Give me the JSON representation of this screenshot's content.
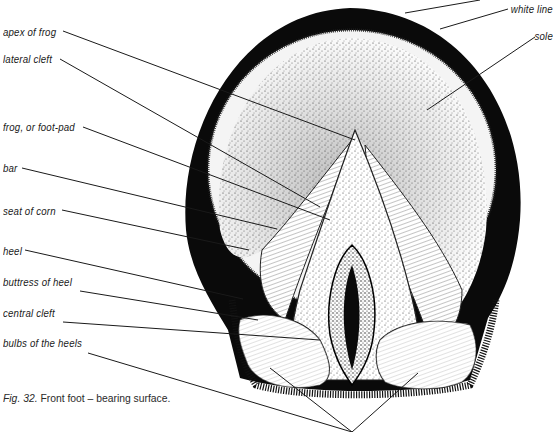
{
  "figure": {
    "caption_prefix": "Fig. 32.",
    "caption_text": " Front foot – bearing surface."
  },
  "labels_left": [
    {
      "id": "apex-of-frog",
      "text": "apex of frog",
      "x": 3,
      "y": 26
    },
    {
      "id": "lateral-cleft",
      "text": "lateral cleft",
      "x": 3,
      "y": 53
    },
    {
      "id": "frog",
      "text": "frog, or foot-pad",
      "x": 3,
      "y": 121
    },
    {
      "id": "bar",
      "text": "bar",
      "x": 3,
      "y": 162
    },
    {
      "id": "seat-of-corn",
      "text": "seat of corn",
      "x": 3,
      "y": 205
    },
    {
      "id": "heel",
      "text": "heel",
      "x": 3,
      "y": 245
    },
    {
      "id": "buttress-of-heel",
      "text": "buttress of heel",
      "x": 3,
      "y": 276
    },
    {
      "id": "central-cleft",
      "text": "central cleft",
      "x": 3,
      "y": 307
    },
    {
      "id": "bulbs-of-the-heels",
      "text": "bulbs of the heels",
      "x": 3,
      "y": 337
    }
  ],
  "labels_right": [
    {
      "id": "white-line",
      "text": "white line",
      "x": 509,
      "y": 3
    },
    {
      "id": "sole",
      "text": "sole",
      "x": 537,
      "y": 30
    }
  ],
  "colors": {
    "ink": "#0a0a0a",
    "paper": "#ffffff",
    "stipple": "#6b6b6b",
    "text": "#1a1a1a"
  }
}
